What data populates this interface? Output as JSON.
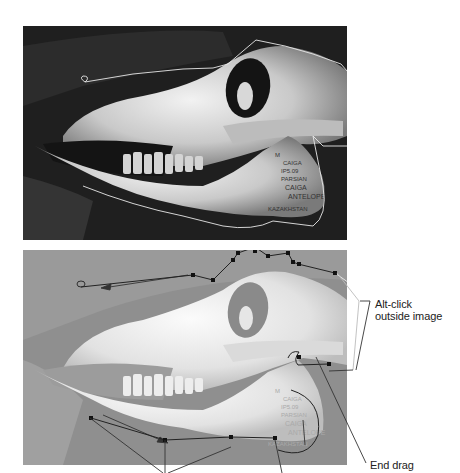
{
  "figure": {
    "top_image": {
      "subject": "animal skull (saiga antelope) on dark background",
      "selection_path": "freehand lasso outline",
      "specimen_label_lines": [
        "M",
        "CAIGA",
        "IP5.09",
        "PARSIAN",
        "CAIGA",
        "ANTELOPE",
        "KAZAKHSTAN"
      ]
    },
    "bottom_image": {
      "subject": "same skull, lightened, with polygonal lasso points",
      "selection_path": "polygon lasso with anchor points"
    },
    "callouts": {
      "alt_click": {
        "line1": "Alt-click",
        "line2": "outside image"
      },
      "end_drag": "End drag"
    },
    "colors": {
      "top_bg": "#1c1c1c",
      "bottom_bg": "#8e8e8e",
      "bone_light": "#e8e8e8",
      "path_line": "#222222",
      "marquee": "#f0f0f0"
    }
  }
}
